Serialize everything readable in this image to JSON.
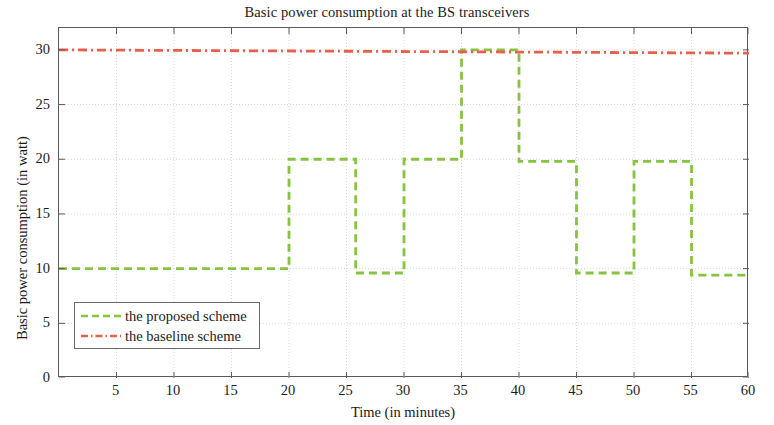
{
  "chart_data": {
    "type": "line",
    "title": "Basic power consumption at the BS transceivers",
    "xlabel": "Time (in minutes)",
    "ylabel": "Basic power consumption (in watt)",
    "xlim": [
      0,
      60
    ],
    "ylim": [
      0,
      32
    ],
    "grid": true,
    "xticks": [
      5,
      10,
      15,
      20,
      25,
      30,
      35,
      40,
      45,
      50,
      55,
      60
    ],
    "yticks": [
      0,
      5,
      10,
      15,
      20,
      25,
      30
    ],
    "legend_position": "lower-left",
    "series": [
      {
        "name": "the proposed scheme",
        "color": "#86c440",
        "style": "dashed",
        "shape": "step",
        "x": [
          0,
          20,
          20,
          25.8,
          25.8,
          30,
          30,
          35,
          35,
          40,
          40,
          45,
          45,
          50,
          50,
          55,
          55,
          60
        ],
        "y": [
          10,
          10,
          20,
          20,
          9.6,
          9.6,
          20,
          20,
          30,
          30,
          19.8,
          19.8,
          9.6,
          9.6,
          19.8,
          19.8,
          9.4,
          9.4
        ]
      },
      {
        "name": "the baseline scheme",
        "color": "#e8604c",
        "style": "dashdot",
        "shape": "line",
        "x": [
          0,
          60
        ],
        "y": [
          30,
          29.7
        ]
      }
    ]
  },
  "legend": {
    "items": [
      {
        "label": "the proposed scheme",
        "color": "#86c440",
        "style": "dashed"
      },
      {
        "label": "the baseline scheme",
        "color": "#e8604c",
        "style": "dashdot"
      }
    ]
  },
  "axes": {
    "x_tick_labels": [
      "5",
      "10",
      "15",
      "20",
      "25",
      "30",
      "35",
      "40",
      "45",
      "50",
      "55",
      "60"
    ],
    "y_tick_labels": [
      "0",
      "5",
      "10",
      "15",
      "20",
      "25",
      "30"
    ]
  }
}
